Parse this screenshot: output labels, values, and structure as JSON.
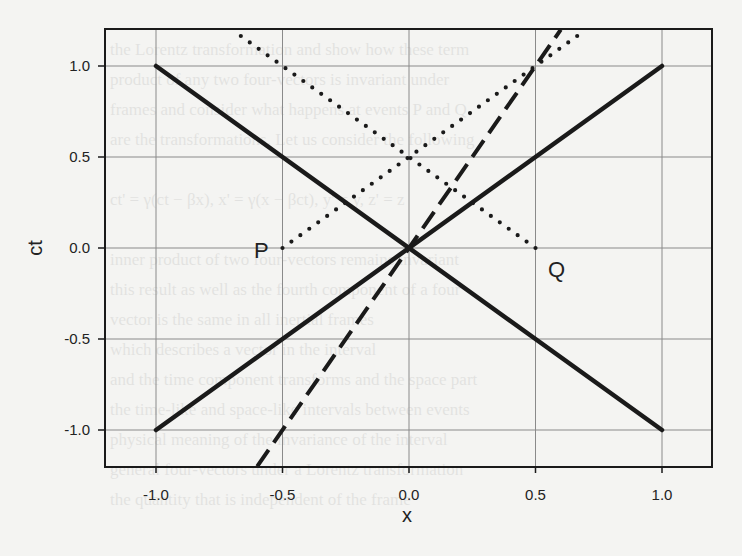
{
  "chart_data": {
    "type": "line",
    "title": "",
    "xlabel": "x",
    "ylabel": "ct",
    "xlim": [
      -1.2,
      1.2
    ],
    "ylim": [
      -1.2,
      1.2
    ],
    "grid": true,
    "x_ticks": [
      "-1.0",
      "-0.5",
      "0.0",
      "0.5",
      "1.0"
    ],
    "y_ticks": [
      "1.0",
      "0.5",
      "0.0",
      "-0.5",
      "-1.0"
    ],
    "series": [
      {
        "name": "light-cone-left",
        "style": "solid",
        "points": [
          [
            -1.0,
            1.0
          ],
          [
            1.0,
            -1.0
          ]
        ]
      },
      {
        "name": "light-cone-right",
        "style": "solid",
        "points": [
          [
            -1.0,
            -1.0
          ],
          [
            1.0,
            1.0
          ]
        ]
      },
      {
        "name": "moving-worldline",
        "style": "dashed",
        "points": [
          [
            -0.6,
            -1.2
          ],
          [
            0.6,
            1.2
          ]
        ]
      },
      {
        "name": "light-signal-from-P",
        "style": "dotted",
        "points": [
          [
            -0.5,
            0.0
          ],
          [
            0.7,
            1.2
          ]
        ]
      },
      {
        "name": "light-signal-from-Q",
        "style": "dotted",
        "points": [
          [
            0.5,
            0.0
          ],
          [
            -0.7,
            1.2
          ]
        ]
      }
    ],
    "annotations": [
      {
        "label": "P",
        "x": -0.5,
        "y": 0.0
      },
      {
        "label": "Q",
        "x": 0.5,
        "y": 0.0
      }
    ]
  },
  "labels": {
    "x_axis": "x",
    "y_axis": "ct",
    "point_p": "P",
    "point_q": "Q",
    "x_ticks": [
      "-1.0",
      "-0.5",
      "0.0",
      "0.5",
      "1.0"
    ],
    "y_ticks": [
      "1.0",
      "0.5",
      "0.0",
      "-0.5",
      "-1.0"
    ]
  },
  "colors": {
    "ink": "#1a1a1a",
    "grid": "#8a8a8a",
    "paper": "#f4f4f2"
  }
}
